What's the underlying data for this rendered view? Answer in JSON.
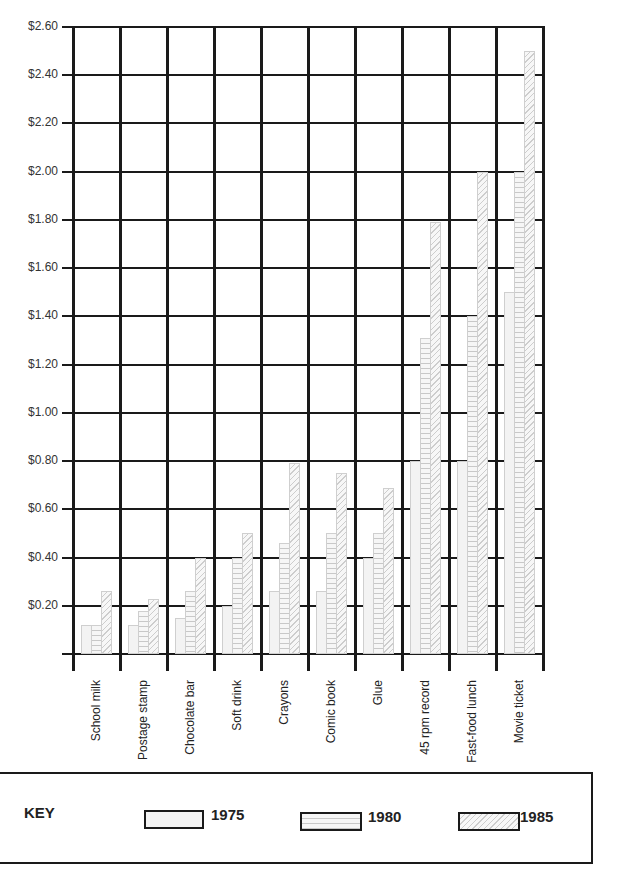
{
  "chart_data": {
    "type": "bar",
    "title": "",
    "xlabel": "",
    "ylabel": "",
    "ylim": [
      0,
      2.6
    ],
    "y_ticks": [
      "$0.20",
      "$0.40",
      "$0.60",
      "$0.80",
      "$1.00",
      "$1.20",
      "$1.40",
      "$1.60",
      "$1.80",
      "$2.00",
      "$2.20",
      "$2.40",
      "$2.60"
    ],
    "categories": [
      "School milk",
      "Postage stamp",
      "Chocolate bar",
      "Soft drink",
      "Crayons",
      "Comic book",
      "Glue",
      "45 rpm record",
      "Fast-food lunch",
      "Movie ticket"
    ],
    "series": [
      {
        "name": "1975",
        "values": [
          0.12,
          0.12,
          0.15,
          0.2,
          0.26,
          0.26,
          0.4,
          0.8,
          0.8,
          1.5
        ]
      },
      {
        "name": "1980",
        "values": [
          0.12,
          0.18,
          0.26,
          0.4,
          0.46,
          0.5,
          0.5,
          1.31,
          1.4,
          2.0
        ]
      },
      {
        "name": "1985",
        "values": [
          0.26,
          0.23,
          0.4,
          0.5,
          0.79,
          0.75,
          0.69,
          1.79,
          2.0,
          2.5
        ]
      }
    ],
    "grid": true,
    "legend_position": "bottom"
  },
  "key": {
    "title": "KEY",
    "items": [
      {
        "label": "1975",
        "pattern": "plain"
      },
      {
        "label": "1980",
        "pattern": "horizontal-lines"
      },
      {
        "label": "1985",
        "pattern": "diagonal-lines"
      }
    ]
  }
}
